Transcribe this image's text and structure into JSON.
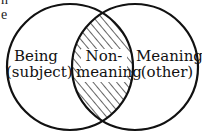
{
  "diagram": {
    "type": "venn",
    "colors": {
      "stroke": "#111111",
      "hatch": "#222222",
      "background": "#ffffff"
    },
    "circles": [
      {
        "name": "Being",
        "cx": 70,
        "cy": 67,
        "r": 63
      },
      {
        "name": "Meaning",
        "cx": 135,
        "cy": 67,
        "r": 63
      }
    ],
    "regions": {
      "left": {
        "line1": "Being",
        "line2": "(subject)"
      },
      "center": {
        "line1": "Non-",
        "line2": "meaning",
        "hatched": true
      },
      "right": {
        "line1": "Meaning",
        "line2": "(other)"
      }
    },
    "cropped_text_fragments": [
      "n",
      "e"
    ]
  }
}
